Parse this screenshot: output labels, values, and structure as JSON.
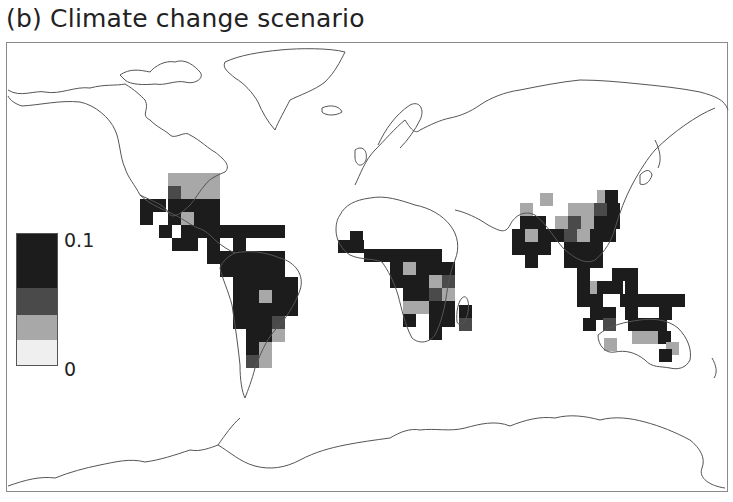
{
  "title": "(b) Climate change scenario",
  "legend": {
    "max_label": "0.1",
    "min_label": "0",
    "swatches": [
      {
        "level": "highest",
        "color": "#1c1c1c",
        "height": 55
      },
      {
        "level": "high",
        "color": "#4a4a4a",
        "height": 27
      },
      {
        "level": "medium",
        "color": "#a8a8a8",
        "height": 25
      },
      {
        "level": "low",
        "color": "#efefef",
        "height": 26
      }
    ]
  },
  "colors": {
    "coastline": "#555555",
    "level_3": "#1c1c1c",
    "level_2": "#4a4a4a",
    "level_1": "#a8a8a8",
    "level_0": "#e6e6e6"
  },
  "grid": {
    "cell": 13,
    "americas": [
      [
        168,
        173,
        1
      ],
      [
        181,
        173,
        1
      ],
      [
        194,
        173,
        1
      ],
      [
        207,
        173,
        1
      ],
      [
        168,
        186,
        2
      ],
      [
        181,
        186,
        1
      ],
      [
        194,
        186,
        1
      ],
      [
        207,
        186,
        1
      ],
      [
        168,
        199,
        3
      ],
      [
        181,
        199,
        3
      ],
      [
        194,
        199,
        3
      ],
      [
        207,
        199,
        3
      ],
      [
        194,
        212,
        3
      ],
      [
        207,
        212,
        3
      ],
      [
        140,
        199,
        3
      ],
      [
        153,
        199,
        3
      ],
      [
        140,
        212,
        3
      ],
      [
        168,
        212,
        3
      ],
      [
        181,
        212,
        1
      ],
      [
        207,
        225,
        3
      ],
      [
        159,
        225,
        3
      ],
      [
        181,
        225,
        3
      ],
      [
        194,
        225,
        3
      ],
      [
        220,
        225,
        3
      ],
      [
        233,
        225,
        3
      ],
      [
        246,
        225,
        3
      ],
      [
        259,
        225,
        3
      ],
      [
        272,
        225,
        3
      ],
      [
        172,
        238,
        3
      ],
      [
        185,
        238,
        3
      ],
      [
        207,
        238,
        3
      ],
      [
        233,
        238,
        3
      ],
      [
        207,
        251,
        3
      ],
      [
        220,
        251,
        3
      ],
      [
        233,
        251,
        3
      ],
      [
        246,
        251,
        3
      ],
      [
        259,
        251,
        3
      ],
      [
        272,
        251,
        3
      ],
      [
        220,
        264,
        3
      ],
      [
        233,
        264,
        3
      ],
      [
        246,
        264,
        3
      ],
      [
        259,
        264,
        3
      ],
      [
        272,
        264,
        3
      ],
      [
        233,
        277,
        3
      ],
      [
        246,
        277,
        3
      ],
      [
        259,
        277,
        3
      ],
      [
        272,
        277,
        3
      ],
      [
        285,
        277,
        3
      ],
      [
        233,
        290,
        3
      ],
      [
        246,
        290,
        3
      ],
      [
        259,
        290,
        1
      ],
      [
        272,
        290,
        3
      ],
      [
        285,
        290,
        3
      ],
      [
        233,
        303,
        3
      ],
      [
        246,
        303,
        3
      ],
      [
        259,
        303,
        3
      ],
      [
        272,
        303,
        3
      ],
      [
        285,
        303,
        3
      ],
      [
        233,
        316,
        3
      ],
      [
        246,
        316,
        3
      ],
      [
        259,
        316,
        3
      ],
      [
        272,
        316,
        2
      ],
      [
        246,
        329,
        3
      ],
      [
        259,
        329,
        3
      ],
      [
        272,
        329,
        1
      ],
      [
        246,
        342,
        3
      ],
      [
        259,
        342,
        1
      ],
      [
        246,
        355,
        2
      ],
      [
        259,
        355,
        1
      ]
    ],
    "africa": [
      [
        350,
        231,
        3
      ],
      [
        338,
        240,
        3
      ],
      [
        351,
        240,
        3
      ],
      [
        364,
        249,
        3
      ],
      [
        377,
        249,
        3
      ],
      [
        390,
        249,
        3
      ],
      [
        403,
        249,
        3
      ],
      [
        416,
        249,
        3
      ],
      [
        429,
        249,
        3
      ],
      [
        390,
        262,
        3
      ],
      [
        403,
        262,
        1
      ],
      [
        416,
        262,
        3
      ],
      [
        429,
        262,
        3
      ],
      [
        442,
        262,
        3
      ],
      [
        390,
        275,
        3
      ],
      [
        403,
        275,
        3
      ],
      [
        416,
        275,
        3
      ],
      [
        429,
        275,
        1
      ],
      [
        442,
        275,
        2
      ],
      [
        403,
        288,
        3
      ],
      [
        416,
        288,
        3
      ],
      [
        429,
        288,
        2
      ],
      [
        442,
        288,
        1
      ],
      [
        403,
        301,
        1
      ],
      [
        416,
        301,
        1
      ],
      [
        429,
        301,
        3
      ],
      [
        442,
        301,
        3
      ],
      [
        403,
        314,
        3
      ],
      [
        429,
        314,
        3
      ],
      [
        442,
        314,
        3
      ],
      [
        429,
        327,
        3
      ],
      [
        459,
        305,
        3
      ],
      [
        459,
        318,
        2
      ]
    ],
    "asia": [
      [
        540,
        193,
        1
      ],
      [
        597,
        190,
        1
      ],
      [
        605,
        190,
        3
      ],
      [
        520,
        203,
        1
      ],
      [
        568,
        203,
        1
      ],
      [
        581,
        203,
        1
      ],
      [
        594,
        203,
        2
      ],
      [
        607,
        203,
        3
      ],
      [
        520,
        216,
        3
      ],
      [
        533,
        216,
        3
      ],
      [
        555,
        216,
        1
      ],
      [
        568,
        216,
        2
      ],
      [
        581,
        216,
        1
      ],
      [
        594,
        216,
        3
      ],
      [
        607,
        216,
        3
      ],
      [
        512,
        229,
        3
      ],
      [
        525,
        229,
        1
      ],
      [
        538,
        229,
        3
      ],
      [
        551,
        229,
        3
      ],
      [
        564,
        229,
        2
      ],
      [
        577,
        229,
        1
      ],
      [
        590,
        229,
        3
      ],
      [
        603,
        229,
        3
      ],
      [
        512,
        242,
        3
      ],
      [
        525,
        242,
        3
      ],
      [
        538,
        242,
        3
      ],
      [
        564,
        242,
        3
      ],
      [
        577,
        242,
        3
      ],
      [
        590,
        242,
        3
      ],
      [
        525,
        255,
        3
      ],
      [
        564,
        255,
        3
      ],
      [
        577,
        255,
        3
      ],
      [
        590,
        255,
        3
      ],
      [
        577,
        268,
        3
      ],
      [
        612,
        268,
        3
      ],
      [
        625,
        268,
        3
      ],
      [
        577,
        281,
        3
      ],
      [
        590,
        281,
        1
      ],
      [
        597,
        281,
        3
      ],
      [
        610,
        281,
        3
      ],
      [
        625,
        281,
        3
      ],
      [
        577,
        294,
        3
      ],
      [
        590,
        294,
        3
      ],
      [
        620,
        294,
        3
      ],
      [
        633,
        294,
        3
      ],
      [
        646,
        294,
        3
      ],
      [
        659,
        294,
        3
      ],
      [
        672,
        294,
        3
      ],
      [
        590,
        307,
        3
      ],
      [
        603,
        307,
        3
      ],
      [
        625,
        307,
        3
      ],
      [
        659,
        307,
        3
      ],
      [
        583,
        318,
        3
      ],
      [
        603,
        318,
        2
      ],
      [
        628,
        318,
        3
      ],
      [
        641,
        318,
        3
      ],
      [
        654,
        318,
        3
      ],
      [
        632,
        331,
        1
      ],
      [
        645,
        331,
        1
      ],
      [
        658,
        331,
        3
      ],
      [
        604,
        338,
        1
      ],
      [
        666,
        342,
        1
      ],
      [
        659,
        349,
        3
      ]
    ]
  }
}
